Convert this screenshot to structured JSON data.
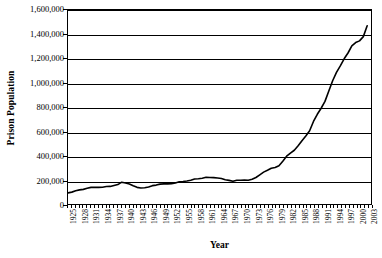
{
  "chart_data": {
    "type": "line",
    "title": "",
    "xlabel": "Year",
    "ylabel": "Prison Population",
    "ylim": [
      0,
      1600000
    ],
    "xlim": [
      1925,
      2004
    ],
    "grid": true,
    "legend": "none",
    "y_ticks": [
      0,
      200000,
      400000,
      600000,
      800000,
      1000000,
      1200000,
      1400000,
      1600000
    ],
    "y_tick_labels": [
      "0",
      "200,000",
      "400,000",
      "600,000",
      "800,000",
      "1,000,000",
      "1,200,000",
      "1,400,000",
      "1,600,000"
    ],
    "x_tick_labels": [
      "1925",
      "1928",
      "1931",
      "1934",
      "1937",
      "1940",
      "1943",
      "1946",
      "1949",
      "1952",
      "1955",
      "1958",
      "1961",
      "1964",
      "1967",
      "1970",
      "1973",
      "1976",
      "1979",
      "1982",
      "1985",
      "1988",
      "1991",
      "1994",
      "1997",
      "2000",
      "2003"
    ],
    "x_tick_step_years": 3,
    "series": [
      {
        "name": "Prison Population",
        "color": "#000000",
        "x": [
          1925,
          1926,
          1927,
          1928,
          1929,
          1930,
          1931,
          1932,
          1933,
          1934,
          1935,
          1936,
          1937,
          1938,
          1939,
          1940,
          1941,
          1942,
          1943,
          1944,
          1945,
          1946,
          1947,
          1948,
          1949,
          1950,
          1951,
          1952,
          1953,
          1954,
          1955,
          1956,
          1957,
          1958,
          1959,
          1960,
          1961,
          1962,
          1963,
          1964,
          1965,
          1966,
          1967,
          1968,
          1969,
          1970,
          1971,
          1972,
          1973,
          1974,
          1975,
          1976,
          1977,
          1978,
          1979,
          1980,
          1981,
          1982,
          1983,
          1984,
          1985,
          1986,
          1987,
          1988,
          1989,
          1990,
          1991,
          1992,
          1993,
          1994,
          1995,
          1996,
          1997,
          1998,
          1999,
          2000,
          2001,
          2002,
          2003
        ],
        "values": [
          91669,
          97991,
          109346,
          116390,
          120496,
          129453,
          137082,
          137997,
          136810,
          138316,
          144180,
          145038,
          152741,
          160285,
          179818,
          173706,
          165439,
          150384,
          137220,
          132456,
          133649,
          140079,
          151304,
          155977,
          163749,
          166123,
          165680,
          168233,
          173579,
          182901,
          185780,
          189565,
          195414,
          205643,
          208105,
          212953,
          220149,
          218830,
          217283,
          214336,
          210895,
          199654,
          194896,
          187914,
          196007,
          196429,
          198061,
          196092,
          204211,
          218466,
          240593,
          262833,
          278141,
          294396,
          301470,
          315974,
          353167,
          394374,
          419820,
          443398,
          480568,
          522084,
          560812,
          603732,
          680907,
          739980,
          789610,
          846277,
          932074,
          1016691,
          1085022,
          1138984,
          1197590,
          1245402,
          1304074,
          1331278,
          1345217,
          1380516,
          1470045
        ]
      }
    ]
  }
}
